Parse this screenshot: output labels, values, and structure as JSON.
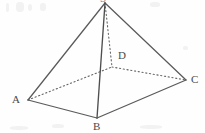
{
  "figure": {
    "width": 205,
    "height": 133,
    "background_color": "#fefefe",
    "stroke_color": "#555555",
    "label_color": "#4a4a4a",
    "vertices": [
      {
        "id": "apex",
        "label": "S",
        "x": 105,
        "y": 3,
        "label_x": 100,
        "label_y": -6,
        "visible_label": false
      },
      {
        "id": "A",
        "label": "A",
        "x": 28,
        "y": 100,
        "label_x": 12,
        "label_y": 94,
        "visible_label": true
      },
      {
        "id": "B",
        "label": "B",
        "x": 97,
        "y": 118,
        "label_x": 93,
        "label_y": 121,
        "visible_label": true
      },
      {
        "id": "C",
        "label": "C",
        "x": 186,
        "y": 80,
        "label_x": 191,
        "label_y": 74,
        "visible_label": true
      },
      {
        "id": "D",
        "label": "D",
        "x": 112,
        "y": 67,
        "label_x": 118,
        "label_y": 50,
        "visible_label": true
      }
    ],
    "edges": [
      {
        "id": "apex-A",
        "from": "apex",
        "to": "A",
        "style": "solid"
      },
      {
        "id": "apex-B",
        "from": "apex",
        "to": "B",
        "style": "solid"
      },
      {
        "id": "apex-C",
        "from": "apex",
        "to": "C",
        "style": "solid"
      },
      {
        "id": "apex-D",
        "from": "apex",
        "to": "D",
        "style": "dotted"
      },
      {
        "id": "A-B",
        "from": "A",
        "to": "B",
        "style": "solid"
      },
      {
        "id": "B-C",
        "from": "B",
        "to": "C",
        "style": "solid"
      },
      {
        "id": "A-D",
        "from": "A",
        "to": "D",
        "style": "dotted"
      },
      {
        "id": "D-C",
        "from": "D",
        "to": "C",
        "style": "dotted"
      }
    ]
  }
}
